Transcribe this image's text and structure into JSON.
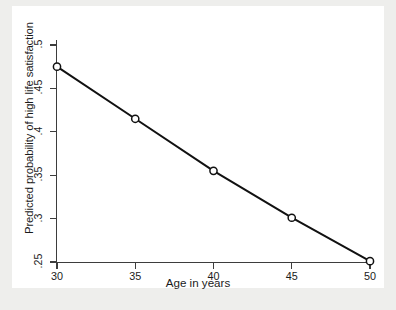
{
  "chart_data": {
    "type": "line",
    "title": "",
    "subtitle": "",
    "xlabel": "Age in years",
    "ylabel": "Predicted probability of high life satisfaction",
    "x": [
      30,
      35,
      40,
      45,
      50
    ],
    "y": [
      0.475,
      0.415,
      0.355,
      0.301,
      0.251
    ],
    "xtick_labels": [
      "30",
      "35",
      "40",
      "45",
      "50"
    ],
    "ytick_labels": [
      ".25",
      ".3",
      ".35",
      ".4",
      ".45",
      ".5"
    ],
    "ytick_values": [
      0.25,
      0.3,
      0.35,
      0.4,
      0.45,
      0.5
    ],
    "xlim": [
      30,
      50
    ],
    "ylim": [
      0.25,
      0.5
    ],
    "grid": false,
    "legend": null,
    "series": [
      {
        "name": "Predicted probability",
        "values": [
          0.475,
          0.415,
          0.355,
          0.301,
          0.251
        ],
        "marker": "open-circle",
        "line_color": "#111111",
        "marker_color": "#111111"
      }
    ],
    "annotations": [],
    "colors": {
      "line": "#111111",
      "axis": "#3d3d3d",
      "text": "#1a1a1a",
      "plot_background": "#ffffff",
      "figure_background": "#eeeeec"
    }
  }
}
